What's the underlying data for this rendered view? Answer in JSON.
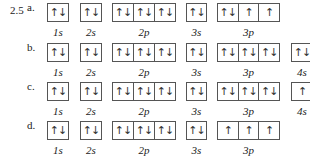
{
  "problem_number": "2.5",
  "arrows": {
    "pair": "↑↓",
    "up": "↑",
    "empty": ""
  },
  "parts": [
    {
      "letter": "a.",
      "subshells": [
        {
          "label": "1s",
          "cells": [
            "↑↓"
          ]
        },
        {
          "label": "2s",
          "cells": [
            "↑↓"
          ]
        },
        {
          "label": "2p",
          "cells": [
            "↑↓",
            "↑↓",
            "↑↓"
          ]
        },
        {
          "label": "3s",
          "cells": [
            "↑↓"
          ]
        },
        {
          "label": "3p",
          "cells": [
            "↑↓",
            "↑",
            "↑"
          ]
        }
      ]
    },
    {
      "letter": "b.",
      "subshells": [
        {
          "label": "1s",
          "cells": [
            "↑↓"
          ]
        },
        {
          "label": "2s",
          "cells": [
            "↑↓"
          ]
        },
        {
          "label": "2p",
          "cells": [
            "↑↓",
            "↑↓",
            "↑↓"
          ]
        },
        {
          "label": "3s",
          "cells": [
            "↑↓"
          ]
        },
        {
          "label": "3p",
          "cells": [
            "↑↓",
            "↑↓",
            "↑↓"
          ]
        },
        {
          "label": "4s",
          "cells": [
            "↑↓"
          ]
        }
      ]
    },
    {
      "letter": "c.",
      "subshells": [
        {
          "label": "1s",
          "cells": [
            "↑↓"
          ]
        },
        {
          "label": "2s",
          "cells": [
            "↑↓"
          ]
        },
        {
          "label": "2p",
          "cells": [
            "↑↓",
            "↑↓",
            "↑↓"
          ]
        },
        {
          "label": "3s",
          "cells": [
            "↑↓"
          ]
        },
        {
          "label": "3p",
          "cells": [
            "↑↓",
            "↑↓",
            "↑↓"
          ]
        },
        {
          "label": "4s",
          "cells": [
            "↑"
          ]
        }
      ]
    },
    {
      "letter": "d.",
      "subshells": [
        {
          "label": "1s",
          "cells": [
            "↑↓"
          ]
        },
        {
          "label": "2s",
          "cells": [
            "↑↓"
          ]
        },
        {
          "label": "2p",
          "cells": [
            "↑↓",
            "↑↓",
            "↑↓"
          ]
        },
        {
          "label": "3s",
          "cells": [
            "↑↓"
          ]
        },
        {
          "label": "3p",
          "cells": [
            "↑",
            "↑",
            "↑"
          ]
        }
      ]
    }
  ]
}
